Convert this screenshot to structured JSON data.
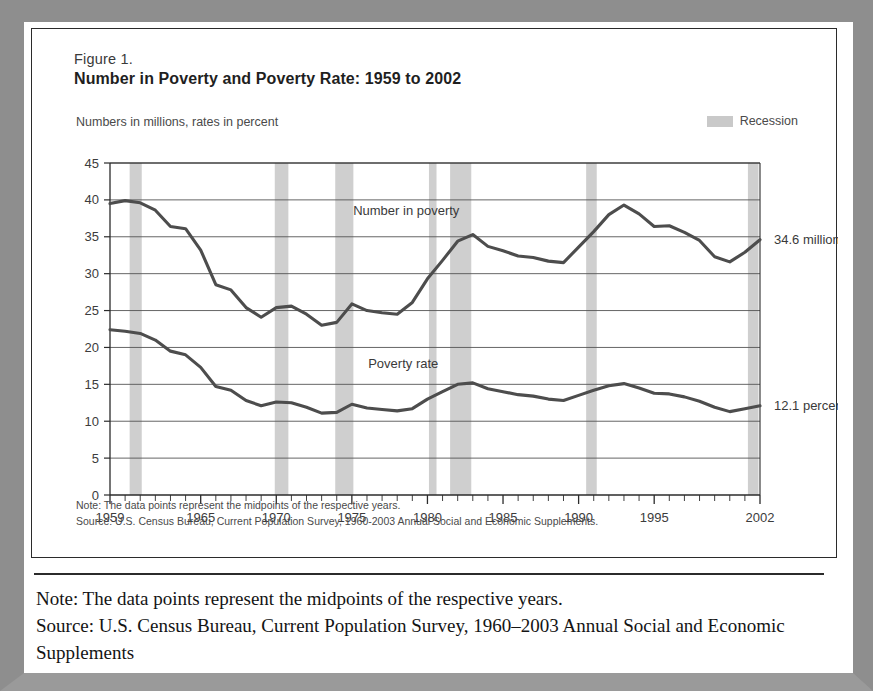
{
  "figure": {
    "label": "Figure 1.",
    "title": "Number in Poverty and Poverty Rate:  1959 to 2002",
    "units_label": "Numbers in millions, rates in percent",
    "legend_label": "Recession",
    "legend_color": "#c9c9c9",
    "note_line": "Note:  The data points represent the midpoints of the respective years.",
    "source_line": "Source:  U.S. Census Bureau, Current Population Survey, 1960-2003 Annual Social and Economic Supplements."
  },
  "caption": {
    "note": "Note: The data points represent the midpoints of the respective years.",
    "source": "Source: U.S. Census Bureau, Current Population Survey, 1960–2003 Annual Social and Economic Supplements"
  },
  "chart_data": {
    "type": "line",
    "title": "Number in Poverty and Poverty Rate:  1959 to 2002",
    "subtitle": "Numbers in millions, rates in percent",
    "xlabel": "",
    "ylabel": "",
    "xlim": [
      1959,
      2002
    ],
    "ylim": [
      0,
      45
    ],
    "grid": true,
    "legend_position": "top-right",
    "yticks": [
      0,
      5,
      10,
      15,
      20,
      25,
      30,
      35,
      40,
      45
    ],
    "ytick_labels": [
      "0",
      "5",
      "10",
      "15",
      "20",
      "25",
      "30",
      "35",
      "40",
      "45"
    ],
    "xticks": [
      1959,
      1965,
      1970,
      1975,
      1980,
      1985,
      1990,
      1995,
      2002
    ],
    "xtick_labels": [
      "1959",
      "1965",
      "1970",
      "1975",
      "1980",
      "1985",
      "1990",
      "1995",
      "2002"
    ],
    "x": [
      1959,
      1960,
      1961,
      1962,
      1963,
      1964,
      1965,
      1966,
      1967,
      1968,
      1969,
      1970,
      1971,
      1972,
      1973,
      1974,
      1975,
      1976,
      1977,
      1978,
      1979,
      1980,
      1981,
      1982,
      1983,
      1984,
      1985,
      1986,
      1987,
      1988,
      1989,
      1990,
      1991,
      1992,
      1993,
      1994,
      1995,
      1996,
      1997,
      1998,
      1999,
      2000,
      2001,
      2002
    ],
    "series": [
      {
        "name": "Number in poverty",
        "unit": "millions",
        "label_x": 1978.6,
        "label_y": 38.0,
        "end_label": "34.6 million",
        "color": "#4d4d4d",
        "values": [
          39.5,
          39.9,
          39.6,
          38.6,
          36.4,
          36.1,
          33.2,
          28.5,
          27.8,
          25.4,
          24.1,
          25.4,
          25.6,
          24.5,
          23.0,
          23.4,
          25.9,
          25.0,
          24.7,
          24.5,
          26.1,
          29.3,
          31.8,
          34.4,
          35.3,
          33.7,
          33.1,
          32.4,
          32.2,
          31.7,
          31.5,
          33.6,
          35.7,
          38.0,
          39.3,
          38.1,
          36.4,
          36.5,
          35.6,
          34.5,
          32.3,
          31.6,
          32.9,
          34.6
        ]
      },
      {
        "name": "Poverty rate",
        "unit": "percent",
        "label_x": 1978.4,
        "label_y": 17.2,
        "end_label": "12.1 percent",
        "color": "#4d4d4d",
        "values": [
          22.4,
          22.2,
          21.9,
          21.0,
          19.5,
          19.0,
          17.3,
          14.7,
          14.2,
          12.8,
          12.1,
          12.6,
          12.5,
          11.9,
          11.1,
          11.2,
          12.3,
          11.8,
          11.6,
          11.4,
          11.7,
          13.0,
          14.0,
          15.0,
          15.2,
          14.4,
          14.0,
          13.6,
          13.4,
          13.0,
          12.8,
          13.5,
          14.2,
          14.8,
          15.1,
          14.5,
          13.8,
          13.7,
          13.3,
          12.7,
          11.9,
          11.3,
          11.7,
          12.1
        ]
      }
    ],
    "recession_bands": [
      {
        "start": 1960.3,
        "end": 1961.1
      },
      {
        "start": 1969.9,
        "end": 1970.8
      },
      {
        "start": 1973.9,
        "end": 1975.1
      },
      {
        "start": 1980.1,
        "end": 1980.6
      },
      {
        "start": 1981.5,
        "end": 1982.9
      },
      {
        "start": 1990.5,
        "end": 1991.2
      },
      {
        "start": 2001.2,
        "end": 2001.9
      }
    ],
    "recession_color": "#cfcfcf"
  }
}
